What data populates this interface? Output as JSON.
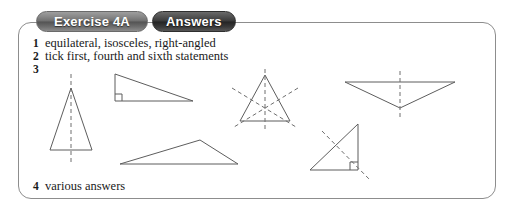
{
  "header": {
    "exercise_label": "Exercise 4A",
    "answers_label": "Answers"
  },
  "answers": [
    {
      "number": "1",
      "text": "equilateral, isosceles, right-angled"
    },
    {
      "number": "2",
      "text": "tick first, fourth and sixth statements"
    },
    {
      "number": "3",
      "text": ""
    },
    {
      "number": "4",
      "text": "various answers"
    }
  ],
  "figures": {
    "caption_for": "3",
    "colors": {
      "shape_stroke": "#5d5d5d",
      "dash_stroke": "#6e6e6e",
      "panel_border": "#8d8d8d",
      "pill_exercise": "#6f6f6f",
      "pill_answers": "#3a3a3a"
    },
    "shapes": [
      {
        "name": "isosceles-triangle",
        "description": "tall isosceles triangle with one vertical line of symmetry",
        "lines_of_symmetry": 1,
        "right_angle": false
      },
      {
        "name": "right-angled-triangle-wide",
        "description": "wide right-angled triangle, right angle at lower left, no line of symmetry",
        "lines_of_symmetry": 0,
        "right_angle": true
      },
      {
        "name": "equilateral-triangle",
        "description": "equilateral triangle with three lines of symmetry",
        "lines_of_symmetry": 3,
        "right_angle": false
      },
      {
        "name": "inverted-isosceles-triangle",
        "description": "wide inverted isosceles triangle with one vertical line of symmetry",
        "lines_of_symmetry": 1,
        "right_angle": false
      },
      {
        "name": "scalene-triangle",
        "description": "scalene obtuse triangle, no lines of symmetry",
        "lines_of_symmetry": 0,
        "right_angle": false
      },
      {
        "name": "right-angled-isosceles-triangle",
        "description": "right-angled isosceles triangle with one diagonal line of symmetry, right angle at lower right",
        "lines_of_symmetry": 1,
        "right_angle": true
      }
    ]
  }
}
